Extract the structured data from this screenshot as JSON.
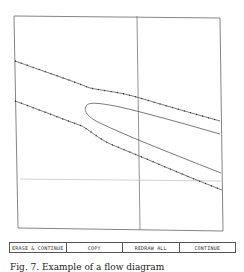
{
  "plot": {
    "frame": {
      "tl": [
        14,
        16
      ],
      "tr": [
        220,
        18
      ],
      "br": [
        223,
        231
      ],
      "bl": [
        18,
        228
      ],
      "color": "#777777"
    },
    "vertical_line": {
      "x1": 137,
      "y1": 16,
      "x2": 140,
      "y2": 230,
      "color": "#777777"
    },
    "horizontal_line": {
      "x1": 20,
      "y1": 179,
      "x2": 221,
      "y2": 181,
      "color": "#bbbbbb"
    },
    "curves": [
      {
        "name": "upper-boundary",
        "dotted": true,
        "d": "M15,61 C40,70 70,80 90,88 C105,91 120,92 140,98 C170,107 195,114 220,121"
      },
      {
        "name": "lower-boundary",
        "dotted": true,
        "d": "M15,101 C40,110 65,120 82,126 C95,134 100,140 115,146 C150,160 185,176 222,190"
      },
      {
        "name": "inner-loop",
        "dotted": false,
        "d": "M220,134 C185,124 150,114 120,107 C100,103 90,102 87,105 C83,109 85,116 100,123 C125,135 160,149 221,173"
      }
    ]
  },
  "toolbar": {
    "buttons": [
      {
        "label": "ERASE & CONTINUE"
      },
      {
        "label": "COPY"
      },
      {
        "label": "REDRAW ALL"
      },
      {
        "label": "CONTINUE"
      }
    ]
  },
  "caption": {
    "text": "Fig. 7. Example of a flow diagram"
  }
}
